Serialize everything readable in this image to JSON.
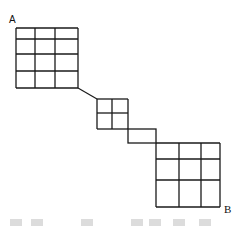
{
  "diagram": {
    "labels": {
      "start": "A",
      "end": "B"
    },
    "stroke_color": "#1a1a1a",
    "watermark_color": "#dcdcdc",
    "shapes": {
      "grid_a": {
        "x": 16,
        "y": 28,
        "cols": [
          16,
          35,
          55,
          78
        ],
        "rows": [
          28,
          39,
          54,
          71,
          88
        ]
      },
      "connector": {
        "x1": 78,
        "y1": 88,
        "x2": 97,
        "y2": 99
      },
      "grid_small": {
        "x": 97,
        "y": 99,
        "cols": [
          97,
          112,
          128
        ],
        "rows": [
          99,
          113,
          129
        ]
      },
      "rect_link": {
        "x": 128,
        "y": 129,
        "w": 28,
        "h": 14
      },
      "grid_b": {
        "cols": [
          156,
          179,
          201,
          220
        ],
        "rows": [
          143,
          159,
          180,
          207
        ]
      }
    },
    "watermark_blocks_x": [
      10,
      31,
      81,
      131,
      149,
      173,
      199
    ]
  }
}
